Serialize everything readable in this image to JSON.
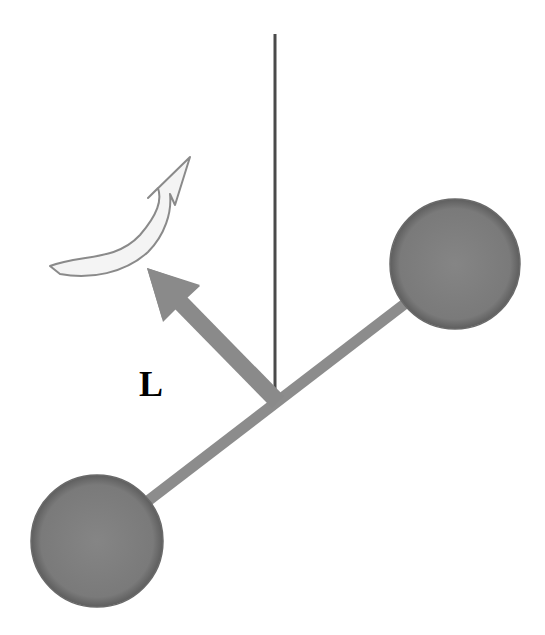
{
  "diagram": {
    "labels": {
      "angular_momentum": "L"
    },
    "elements": {
      "vertical_axis": {
        "x": 275,
        "y1": 34,
        "y2": 400,
        "color": "#4a4a4a"
      },
      "rod": {
        "x1": 97,
        "y1": 540,
        "x2": 455,
        "y2": 265,
        "width": 11,
        "color": "#8c8c8c"
      },
      "mass_top_right": {
        "cx": 455,
        "cy": 264,
        "r": 65,
        "color": "#7d7d7d"
      },
      "mass_bottom_left": {
        "cx": 97,
        "cy": 541,
        "r": 66,
        "color": "#7d7d7d"
      },
      "angular_momentum_arrow": {
        "from": [
          276,
          400
        ],
        "to": [
          147,
          268
        ],
        "color": "#8a8a8a"
      },
      "rotation_arrow": {
        "fill": "#f4f4f4",
        "stroke": "#8a8a8a",
        "direction": "counterclockwise-upward"
      }
    },
    "colors": {
      "background": "#ffffff",
      "gray_fill": "#8a8a8a",
      "dark_line": "#4a4a4a",
      "mass_fill": "#7d7d7d",
      "label_color": "#000000"
    }
  }
}
